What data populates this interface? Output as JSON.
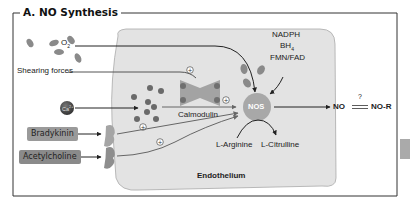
{
  "title": "A. NO Synthesis",
  "cell_label": "Endothelium",
  "stimuli": {
    "oxygen": "O",
    "oxygen_sub": "2",
    "shear": "Shearing forces",
    "calcium": "Ca",
    "calcium_sup": "2+",
    "bradykinin": "Bradykinin",
    "acetylcholine": "Acetylcholine"
  },
  "enzyme": "NOS",
  "calmodulin": "Calmodulin",
  "cofactors": {
    "nadph": "NADPH",
    "bh4": "BH",
    "bh4_sub": "4",
    "fmn": "FMN/FAD"
  },
  "substrate": "L-Arginine",
  "product": "L-Citrulline",
  "output": {
    "no": "NO",
    "question": "?",
    "nor": "NO-R"
  },
  "plus_sign": "+",
  "colors": {
    "cell_fill": "#e3e3e3",
    "cell_stroke": "#9a9a9a",
    "nos_fill": "#a8a8a8",
    "molecule": "#7f7f7f",
    "receptor": "#9c9c9c",
    "calcium": "#444444",
    "arrow": "#333333",
    "frame": "#333333"
  }
}
